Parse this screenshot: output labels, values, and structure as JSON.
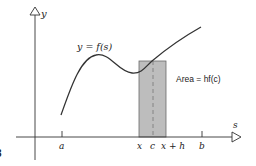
{
  "diagram": {
    "axes": {
      "y_label": "y",
      "x_label": "s"
    },
    "curve_label": "y = f(s)",
    "area_label": "Area = hf(c)",
    "tick_labels": {
      "a": "a",
      "x": "x",
      "c": "c",
      "x_plus_h": "x + h",
      "b": "b"
    },
    "figure_fragment": "3",
    "colors": {
      "axis": "#333333",
      "curve": "#333333",
      "rect_fill": "#bdbdbd",
      "rect_stroke": "#555555",
      "text": "#222222"
    }
  }
}
